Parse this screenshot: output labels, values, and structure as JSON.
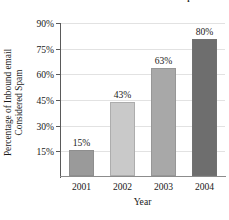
{
  "chart_data": {
    "type": "bar",
    "title": "Share of All Email Considered Spam",
    "categories": [
      "2001",
      "2002",
      "2003",
      "2004"
    ],
    "values": [
      15,
      43,
      63,
      80
    ],
    "data_labels": [
      "15%",
      "43%",
      "63%",
      "80%"
    ],
    "xlabel": "Year",
    "ylabel_line1": "Percentage of Inbound email",
    "ylabel_line2": "Considered Spam",
    "ylim": [
      0,
      90
    ],
    "yticks": [
      90,
      75,
      60,
      45,
      30,
      15
    ],
    "ytick_labels": [
      "90%",
      "75%",
      "60%",
      "45%",
      "30%",
      "15%"
    ],
    "grid": true,
    "legend": "none",
    "bar_colors": [
      "#9a9a9a",
      "#c9c9c9",
      "#a8a8a8",
      "#6e6e6e"
    ],
    "axis_color": "#5a5a5a",
    "gridline_color": "#e2e2e2",
    "background": "#ffffff"
  }
}
